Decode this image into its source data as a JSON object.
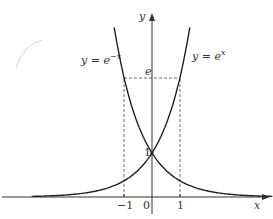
{
  "chart_data": {
    "type": "line",
    "title": "",
    "xlabel": "x",
    "ylabel": "y",
    "series": [
      {
        "name": "y = e^x",
        "function": "exp(x)",
        "x_range": [
          -4.3,
          1.35
        ]
      },
      {
        "name": "y = e^-x",
        "function": "exp(-x)",
        "x_range": [
          -1.35,
          4.3
        ]
      }
    ],
    "x_ticks": [
      "-1",
      "0",
      "1"
    ],
    "y_ticks": [
      "1",
      "e"
    ],
    "guides": [
      {
        "type": "dashed",
        "from": [
          -1,
          0
        ],
        "to": [
          -1,
          2.718
        ]
      },
      {
        "type": "dashed",
        "from": [
          1,
          0
        ],
        "to": [
          1,
          2.718
        ]
      },
      {
        "type": "dashed",
        "from": [
          -1,
          2.718
        ],
        "to": [
          1,
          2.718
        ]
      }
    ],
    "annotations": [
      "y = e^-x",
      "y = e^x",
      "1",
      "e"
    ]
  },
  "labels": {
    "y_axis": "y",
    "x_axis": "x",
    "curve_left_prefix": "y = e",
    "curve_left_exp": "−x",
    "curve_right_prefix": "y = e",
    "curve_right_exp": "x",
    "tick_neg1": "−1",
    "tick_0": "0",
    "tick_1": "1",
    "y_one": "1",
    "y_e": "e"
  }
}
